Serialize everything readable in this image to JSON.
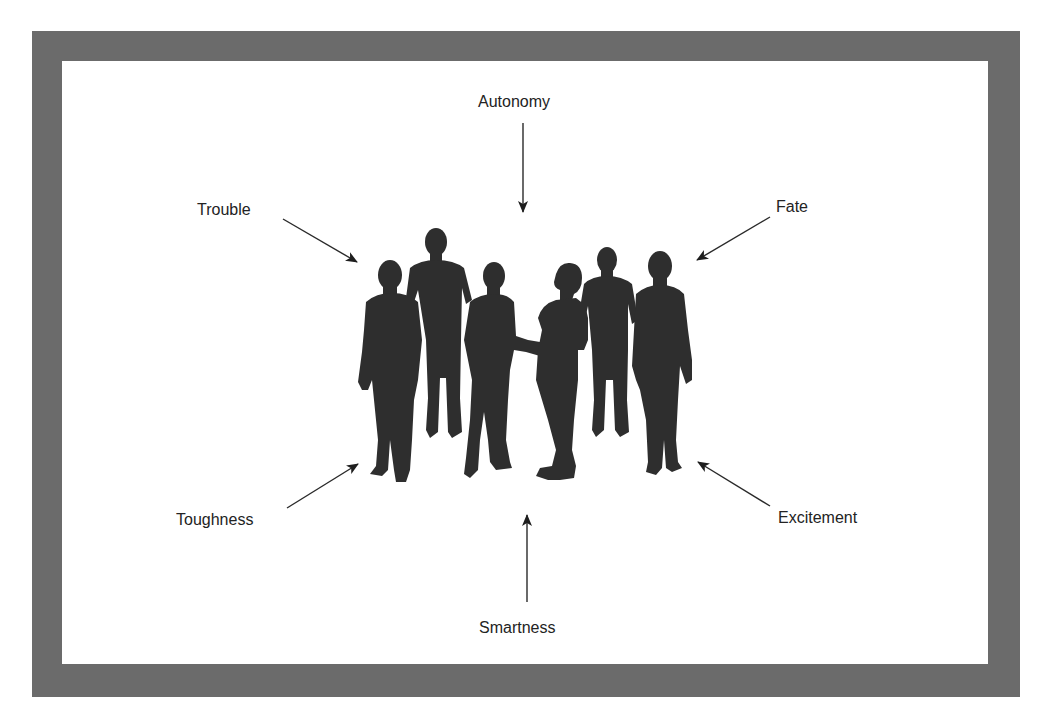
{
  "figure": {
    "frame_color": "#6b6b6b",
    "silhouette_color": "#2e2e2e",
    "text_color": "#232323",
    "center_subject": "group of six people silhouettes",
    "labels": {
      "top": "Autonomy",
      "top_left": "Trouble",
      "top_right": "Fate",
      "bottom_left": "Toughness",
      "bottom_right": "Excitement",
      "bottom": "Smartness"
    },
    "arrows": [
      {
        "from": "Autonomy",
        "direction": "down",
        "points_to": "group"
      },
      {
        "from": "Trouble",
        "direction": "down-right",
        "points_to": "group"
      },
      {
        "from": "Fate",
        "direction": "down-left",
        "points_to": "group"
      },
      {
        "from": "Toughness",
        "direction": "up-right",
        "points_to": "group"
      },
      {
        "from": "Excitement",
        "direction": "up-left",
        "points_to": "group"
      },
      {
        "from": "Smartness",
        "direction": "up",
        "points_to": "group"
      }
    ]
  }
}
